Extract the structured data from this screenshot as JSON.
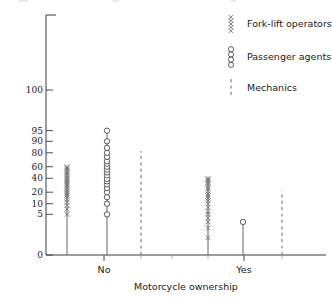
{
  "chart_data": {
    "type": "scatter",
    "title": "",
    "xlabel": "Motorcycle ownership",
    "ylabel": "",
    "categories": [
      "No",
      "Yes"
    ],
    "grid": false,
    "legend_position": "top-right",
    "yticks": [
      0,
      5,
      10,
      20,
      40,
      60,
      80,
      90,
      95,
      100
    ],
    "ytick_labels": [
      "0",
      "5",
      "10",
      "20",
      "40",
      "60",
      "80",
      "90",
      "95",
      "100"
    ],
    "ylim": [
      0,
      100
    ],
    "yscale": "probability",
    "series": [
      {
        "name": "Fork-lift operators",
        "marker": "x",
        "values_no": [
          5,
          7,
          9,
          11,
          13,
          15,
          17,
          19,
          21,
          23,
          25,
          28,
          31,
          34,
          37,
          40,
          43,
          46,
          49,
          52,
          55,
          58,
          60
        ],
        "values_yes": [
          1,
          2,
          3,
          4,
          5,
          6,
          8,
          10,
          12,
          14,
          16,
          18,
          21,
          24,
          27,
          30,
          33,
          36,
          38,
          40
        ]
      },
      {
        "name": "Passenger agents",
        "marker": "o",
        "values_no": [
          5,
          10,
          15,
          20,
          25,
          30,
          35,
          39,
          45,
          50,
          55,
          60,
          65,
          69,
          75,
          80,
          85,
          90,
          95
        ],
        "values_yes": [
          3
        ]
      },
      {
        "name": "Mechanics",
        "marker": "dashed-line",
        "values_no": [
          82
        ],
        "values_yes": [
          22
        ]
      }
    ]
  },
  "axis": {
    "y_axis_name": "percent-axis",
    "x_axis_name": "category-axis"
  },
  "legend": {
    "entries": [
      {
        "label": "Fork-lift operators",
        "marker": "x"
      },
      {
        "label": "Passenger agents",
        "marker": "o"
      },
      {
        "label": "Mechanics",
        "marker": "dashed-line"
      }
    ]
  }
}
